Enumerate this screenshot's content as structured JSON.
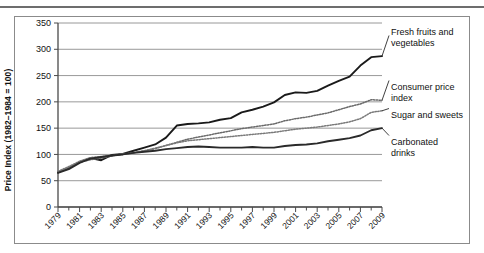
{
  "chart_data": {
    "type": "line",
    "title": "",
    "xlabel": "",
    "ylabel": "Price Index (1982–1984 = 100)",
    "ylim": [
      0,
      350
    ],
    "xlim": [
      1979,
      2009
    ],
    "ytick_labels": [
      "0",
      "50",
      "100",
      "150",
      "200",
      "250",
      "300",
      "350"
    ],
    "ytick_values": [
      0,
      50,
      100,
      150,
      200,
      250,
      300,
      350
    ],
    "xtick_labels": [
      "1979",
      "1981",
      "1983",
      "1985",
      "1987",
      "1989",
      "1991",
      "1993",
      "1995",
      "1997",
      "1999",
      "2001",
      "2003",
      "2005",
      "2007",
      "2009"
    ],
    "xtick_values": [
      1979,
      1981,
      1983,
      1985,
      1987,
      1989,
      1991,
      1993,
      1995,
      1997,
      1999,
      2001,
      2003,
      2005,
      2007,
      2009
    ],
    "minor_ticks_every": 1,
    "grid": "horizontal",
    "legend_position": "right-inline",
    "x": [
      1979,
      1980,
      1981,
      1982,
      1983,
      1984,
      1985,
      1986,
      1987,
      1988,
      1989,
      1990,
      1991,
      1992,
      1993,
      1994,
      1995,
      1996,
      1997,
      1998,
      1999,
      2000,
      2001,
      2002,
      2003,
      2004,
      2005,
      2006,
      2007,
      2008,
      2009
    ],
    "series": [
      {
        "name": "Fresh fruits and vegetables",
        "label": "Fresh fruits and\nvegetables",
        "color": "#1a1a1a",
        "style": "solid",
        "width": 1.9,
        "values": [
          66,
          74,
          86,
          93,
          89,
          99,
          101,
          107,
          113,
          119,
          132,
          155,
          158,
          159,
          161,
          166,
          169,
          180,
          185,
          191,
          199,
          213,
          218,
          217,
          221,
          231,
          240,
          248,
          269,
          285,
          287
        ]
      },
      {
        "name": "Consumer price index",
        "label": "Consumer price\nindex",
        "color": "#6b6b6b",
        "style": "dotted",
        "width": 1.5,
        "values": [
          66,
          75,
          85,
          90,
          93,
          97,
          101,
          103,
          107,
          111,
          117,
          123,
          129,
          133,
          137,
          141,
          145,
          149,
          152,
          155,
          158,
          164,
          168,
          171,
          175,
          179,
          185,
          191,
          196,
          204,
          203
        ]
      },
      {
        "name": "Sugar and sweets",
        "label": "Sugar and sweets",
        "color": "#7a7a7a",
        "style": "dotted",
        "width": 1.5,
        "values": [
          68,
          77,
          87,
          94,
          96,
          98,
          100,
          103,
          107,
          112,
          117,
          122,
          126,
          128,
          130,
          132,
          134,
          136,
          138,
          140,
          142,
          145,
          148,
          150,
          152,
          155,
          158,
          162,
          168,
          180,
          183
        ]
      },
      {
        "name": "Carbonated drinks",
        "label": "Carbonated\ndrinks",
        "color": "#2a2a2a",
        "style": "solid",
        "width": 1.9,
        "values": [
          65,
          72,
          84,
          92,
          95,
          98,
          100,
          103,
          105,
          107,
          110,
          112,
          114,
          115,
          114,
          113,
          113,
          113,
          114,
          113,
          113,
          116,
          118,
          119,
          121,
          125,
          128,
          131,
          136,
          146,
          150
        ]
      }
    ],
    "legend_entries": [
      {
        "label_line1": "Fresh fruits and",
        "label_line2": "vegetables"
      },
      {
        "label_line1": "Consumer price",
        "label_line2": "index"
      },
      {
        "label_line1": "Sugar and sweets",
        "label_line2": ""
      },
      {
        "label_line1": "Carbonated",
        "label_line2": "drinks"
      }
    ]
  }
}
